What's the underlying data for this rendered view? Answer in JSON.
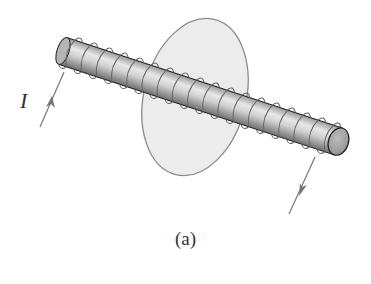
{
  "figure": {
    "caption": "(a)",
    "current_label": "I"
  },
  "colors": {
    "background": "#ffffff",
    "disk_fill": "#ececec",
    "disk_stroke": "#8a8a8a",
    "rod_dark": "#7f7f7f",
    "rod_light": "#e6e6e6",
    "cap_fill": "#a9a9a9",
    "wire": "#777777",
    "outline": "#222222"
  }
}
